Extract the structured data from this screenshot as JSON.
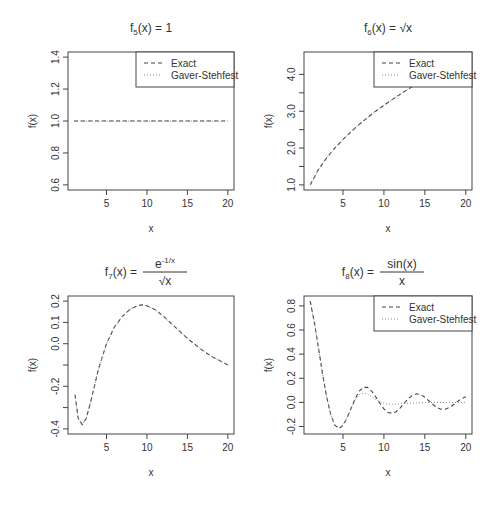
{
  "figure": {
    "layout": "2x2 grid of R base-graphics plots",
    "background": "#ffffff",
    "axis_color": "#444444",
    "exact_color": "#444444",
    "gs_color": "#888888"
  },
  "chart_data": [
    {
      "id": "f5",
      "type": "line",
      "title": "f5(x) = 1",
      "title_parts": {
        "f": "f",
        "sub": "5",
        "rest": "(x) = 1"
      },
      "xlabel": "x",
      "ylabel": "f(x)",
      "xlim": [
        1,
        20
      ],
      "ylim": [
        0.6,
        1.4
      ],
      "xticks": [
        5,
        10,
        15,
        20
      ],
      "yticks": [
        0.6,
        0.8,
        1.0,
        1.2,
        1.4
      ],
      "ytick_labels": [
        "0.6",
        "0.8",
        "1.0",
        "1.2",
        "1.4"
      ],
      "legend": {
        "position": "topright",
        "entries": [
          {
            "label": "Exact",
            "style": "dashed"
          },
          {
            "label": "Gaver-Stehfest",
            "style": "dotted"
          }
        ]
      },
      "series": [
        {
          "name": "Exact",
          "style": "dashed",
          "x": [
            1,
            20
          ],
          "y": [
            1.0,
            1.0
          ]
        },
        {
          "name": "Gaver-Stehfest",
          "style": "dotted",
          "x": [
            1,
            20
          ],
          "y": [
            1.0,
            1.0
          ]
        }
      ],
      "box": {
        "left": 68,
        "top": 52,
        "right": 234,
        "bottom": 190
      }
    },
    {
      "id": "f6",
      "type": "line",
      "title": "f6(x) = sqrt(x)",
      "title_parts": {
        "f": "f",
        "sub": "6",
        "rest": "(x) = √x"
      },
      "xlabel": "x",
      "ylabel": "f(x)",
      "xlim": [
        1,
        20
      ],
      "ylim": [
        1.0,
        4.47
      ],
      "xticks": [
        5,
        10,
        15,
        20
      ],
      "yticks": [
        1.0,
        1.5,
        2.0,
        2.5,
        3.0,
        3.5,
        4.0
      ],
      "ytick_labels": [
        "1.0",
        "",
        "2.0",
        "",
        "3.0",
        "",
        "4.0"
      ],
      "legend": {
        "position": "topright",
        "entries": [
          {
            "label": "Exact",
            "style": "dashed"
          },
          {
            "label": "Gaver-Stehfest",
            "style": "dotted"
          }
        ]
      },
      "series": [
        {
          "name": "Exact",
          "style": "dashed",
          "x": [
            1,
            2,
            3,
            4,
            5,
            6,
            7,
            8,
            9,
            10,
            11,
            12,
            13,
            14,
            15,
            16,
            17,
            18,
            19,
            20
          ],
          "y": [
            1.0,
            1.414,
            1.732,
            2.0,
            2.236,
            2.449,
            2.646,
            2.828,
            3.0,
            3.162,
            3.317,
            3.464,
            3.606,
            3.742,
            3.873,
            4.0,
            4.123,
            4.243,
            4.359,
            4.472
          ]
        },
        {
          "name": "Gaver-Stehfest",
          "style": "dotted",
          "x": [
            1,
            2,
            3,
            4,
            5,
            6,
            7,
            8,
            9,
            10,
            11,
            12,
            13,
            14,
            15,
            16,
            17,
            18,
            19,
            20
          ],
          "y": [
            1.0,
            1.414,
            1.732,
            2.0,
            2.236,
            2.449,
            2.646,
            2.828,
            3.0,
            3.162,
            3.317,
            3.464,
            3.606,
            3.742,
            3.873,
            4.0,
            4.123,
            4.243,
            4.359,
            4.472
          ]
        }
      ],
      "box": {
        "left": 304,
        "top": 52,
        "right": 472,
        "bottom": 190
      }
    },
    {
      "id": "f7",
      "type": "line",
      "title": "f7(x) = e^(-1/x) / sqrt(x)",
      "title_parts": {
        "f": "f",
        "sub": "7",
        "rest": "(x) =",
        "num": "e",
        "num_sup": "-1/x",
        "den": "√x"
      },
      "xlabel": "x",
      "ylabel": "f(x)",
      "xlim": [
        1,
        20
      ],
      "ylim": [
        -0.4,
        0.2
      ],
      "xticks": [
        5,
        10,
        15,
        20
      ],
      "yticks": [
        -0.4,
        -0.3,
        -0.2,
        -0.1,
        0.0,
        0.1,
        0.2
      ],
      "ytick_labels": [
        "-0.4",
        "",
        "-0.2",
        "",
        "0.0",
        "0.1",
        "0.2"
      ],
      "legend": null,
      "series": [
        {
          "name": "Exact",
          "style": "dashed",
          "x": [
            1.1,
            1.5,
            2.0,
            2.5,
            3.0,
            3.5,
            4.0,
            5.0,
            6.0,
            7.0,
            8.0,
            9.0,
            9.5,
            10.0,
            11.0,
            12.0,
            13.0,
            14.0,
            15.0,
            16.0,
            17.0,
            18.0,
            19.0,
            20.0
          ],
          "y": [
            -0.24,
            -0.35,
            -0.38,
            -0.35,
            -0.28,
            -0.2,
            -0.12,
            0.0,
            0.08,
            0.13,
            0.165,
            0.18,
            0.182,
            0.178,
            0.16,
            0.13,
            0.095,
            0.06,
            0.025,
            -0.005,
            -0.035,
            -0.06,
            -0.08,
            -0.1
          ]
        },
        {
          "name": "Gaver-Stehfest",
          "style": "dotted",
          "x": [
            1.1,
            1.5,
            2.0,
            2.5,
            3.0,
            3.5,
            4.0,
            5.0,
            6.0,
            7.0,
            8.0,
            9.0,
            9.5,
            10.0,
            11.0,
            12.0,
            13.0,
            14.0,
            15.0,
            16.0,
            17.0,
            18.0,
            19.0,
            20.0
          ],
          "y": [
            -0.24,
            -0.35,
            -0.38,
            -0.35,
            -0.28,
            -0.2,
            -0.12,
            0.0,
            0.08,
            0.13,
            0.165,
            0.18,
            0.182,
            0.178,
            0.16,
            0.13,
            0.095,
            0.06,
            0.025,
            -0.005,
            -0.035,
            -0.06,
            -0.08,
            -0.1
          ]
        }
      ],
      "box": {
        "left": 68,
        "top": 296,
        "right": 234,
        "bottom": 434
      }
    },
    {
      "id": "f8",
      "type": "line",
      "title": "f8(x) = sin(x) / x",
      "title_parts": {
        "f": "f",
        "sub": "8",
        "rest": "(x) =",
        "num": "sin(x)",
        "den": "x"
      },
      "xlabel": "x",
      "ylabel": "f(x)",
      "xlim": [
        1,
        20
      ],
      "ylim": [
        -0.22,
        0.84
      ],
      "xticks": [
        5,
        10,
        15,
        20
      ],
      "yticks": [
        -0.2,
        0.0,
        0.2,
        0.4,
        0.6,
        0.8
      ],
      "ytick_labels": [
        "-0.2",
        "0.0",
        "0.2",
        "0.4",
        "0.6",
        "0.8"
      ],
      "legend": {
        "position": "topright",
        "entries": [
          {
            "label": "Exact",
            "style": "dashed"
          },
          {
            "label": "Gaver-Stehfest",
            "style": "dotted"
          }
        ]
      },
      "series": [
        {
          "name": "Exact",
          "style": "dashed",
          "x": [
            1,
            1.5,
            2,
            2.5,
            3,
            3.5,
            4,
            4.5,
            5,
            5.5,
            6,
            6.5,
            7,
            7.5,
            8,
            8.5,
            9,
            9.5,
            10,
            10.5,
            11,
            11.5,
            12,
            12.5,
            13,
            13.5,
            14,
            14.5,
            15,
            15.5,
            16,
            16.5,
            17,
            17.5,
            18,
            18.5,
            19,
            19.5,
            20
          ],
          "y": [
            0.841,
            0.665,
            0.455,
            0.239,
            0.047,
            -0.1,
            -0.189,
            -0.217,
            -0.192,
            -0.128,
            -0.047,
            0.033,
            0.094,
            0.125,
            0.124,
            0.094,
            0.046,
            -0.008,
            -0.054,
            -0.084,
            -0.091,
            -0.077,
            -0.045,
            -0.005,
            0.032,
            0.059,
            0.071,
            0.065,
            0.043,
            0.012,
            -0.018,
            -0.043,
            -0.057,
            -0.057,
            -0.042,
            -0.019,
            0.008,
            0.031,
            0.046
          ]
        },
        {
          "name": "Gaver-Stehfest",
          "style": "dotted",
          "x": [
            1,
            1.5,
            2,
            2.5,
            3,
            3.5,
            4,
            4.5,
            5,
            5.5,
            6,
            6.5,
            7,
            7.5,
            8,
            8.5,
            9,
            9.5,
            10,
            10.5,
            11,
            11.5,
            12,
            13,
            14,
            15,
            16,
            17,
            18,
            19,
            20
          ],
          "y": [
            0.841,
            0.665,
            0.455,
            0.239,
            0.047,
            -0.1,
            -0.185,
            -0.212,
            -0.186,
            -0.125,
            -0.05,
            0.02,
            0.065,
            0.078,
            0.07,
            0.05,
            0.025,
            0.005,
            -0.008,
            -0.014,
            -0.016,
            -0.015,
            -0.012,
            -0.008,
            -0.004,
            -0.001,
            0.0,
            0.0,
            0.0,
            0.0,
            0.0
          ]
        }
      ],
      "box": {
        "left": 304,
        "top": 296,
        "right": 472,
        "bottom": 434
      }
    }
  ]
}
